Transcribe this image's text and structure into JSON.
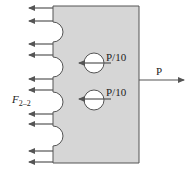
{
  "diagram": {
    "type": "free-body-diagram",
    "plate": {
      "fill": "#d6d6d6",
      "stroke": "#555555"
    },
    "labels": {
      "applied_load": "P",
      "hole_force_1": "P/10",
      "hole_force_2": "P/10",
      "section_force_main": "F",
      "section_force_sub": "2–2"
    },
    "left_arrows_count": 10,
    "notches_count": 4,
    "holes_count": 2,
    "colors": {
      "arrow": "#555555",
      "text": "#222222",
      "background": "#ffffff"
    }
  }
}
